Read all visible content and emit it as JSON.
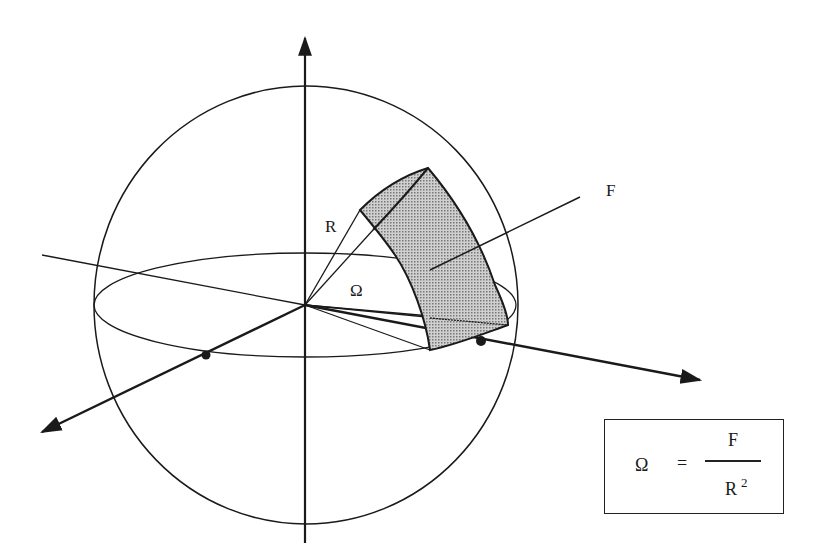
{
  "diagram": {
    "labels": {
      "radius": "R",
      "area": "F",
      "solid_angle": "Ω"
    },
    "formula": {
      "lhs": "Ω",
      "equals": "=",
      "numerator": "F",
      "denominator_base": "R",
      "denominator_exponent": "2"
    },
    "colors": {
      "line": "#1a1a1a",
      "patch_fill": "#b8b8b8",
      "background": "#ffffff"
    }
  }
}
